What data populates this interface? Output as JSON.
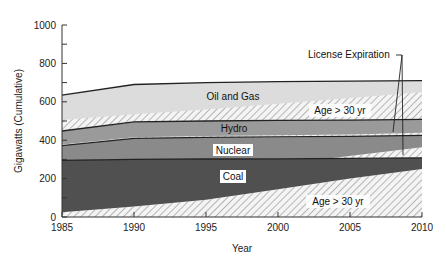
{
  "chart_data": {
    "type": "area",
    "title": "",
    "xlabel": "Year",
    "ylabel": "Gigawatts (Cumulative)",
    "xlim": [
      1985,
      2010
    ],
    "ylim": [
      0,
      1000
    ],
    "x_ticks": [
      1985,
      1990,
      1995,
      2000,
      2005,
      2010
    ],
    "y_ticks": [
      0,
      200,
      400,
      600,
      800,
      1000
    ],
    "y_minor_step": 100,
    "grid": false,
    "x": [
      1985,
      1990,
      1995,
      2000,
      2005,
      2010
    ],
    "series": [
      {
        "name": "Coal",
        "cumulative_top": [
          295,
          300,
          302,
          303,
          305,
          308
        ],
        "fill": "#505050"
      },
      {
        "name": "Nuclear",
        "cumulative_top": [
          372,
          410,
          415,
          418,
          420,
          425
        ],
        "fill": "#8a8a8a"
      },
      {
        "name": "Hydro",
        "cumulative_top": [
          448,
          495,
          500,
          503,
          505,
          508
        ],
        "fill": "#9a9a9a"
      },
      {
        "name": "Oil and Gas",
        "cumulative_top": [
          635,
          690,
          700,
          705,
          708,
          710
        ],
        "fill": "#dcdcdc"
      }
    ],
    "age_over_30_regions": [
      {
        "applies_to": "Coal",
        "label": "Age > 30 yr",
        "top": [
          25,
          55,
          90,
          145,
          200,
          250
        ],
        "bottom": [
          0,
          0,
          0,
          0,
          0,
          0
        ]
      },
      {
        "applies_to": "Nuclear",
        "label": "",
        "top": [
          372,
          410,
          412,
          414,
          330,
          360
        ],
        "bottom_note": "hatched sliver appears near 2005-2010 above Coal"
      },
      {
        "applies_to": "Hydro",
        "label": "",
        "top": [
          380,
          415,
          420,
          425,
          430,
          440
        ],
        "bottom": [
          372,
          410,
          415,
          418,
          420,
          425
        ]
      },
      {
        "applies_to": "Oil and Gas",
        "label": "Age > 30 yr",
        "top": [
          505,
          535,
          560,
          590,
          620,
          650
        ],
        "bottom": [
          448,
          495,
          500,
          503,
          505,
          508
        ]
      }
    ],
    "annotations": [
      {
        "text": "License Expiration",
        "points_to": [
          "Hydro age hatch ~2008",
          "Nuclear age hatch ~2009"
        ]
      },
      {
        "text": "Oil and Gas"
      },
      {
        "text": "Hydro"
      },
      {
        "text": "Nuclear"
      },
      {
        "text": "Coal"
      },
      {
        "text": "Age > 30 yr",
        "position": "upper"
      },
      {
        "text": "Age > 30 yr",
        "position": "lower"
      }
    ]
  },
  "labels": {
    "ylabel": "Gigawatts (Cumulative)",
    "xlabel": "Year",
    "oil_gas": "Oil and Gas",
    "hydro": "Hydro",
    "nuclear": "Nuclear",
    "coal": "Coal",
    "age_upper": "Age > 30 yr",
    "age_lower": "Age > 30 yr",
    "license": "License Expiration",
    "x_ticks": [
      "1985",
      "1990",
      "1995",
      "2000",
      "2005",
      "2010"
    ],
    "y_ticks": [
      "0",
      "200",
      "400",
      "600",
      "800",
      "1000"
    ]
  }
}
